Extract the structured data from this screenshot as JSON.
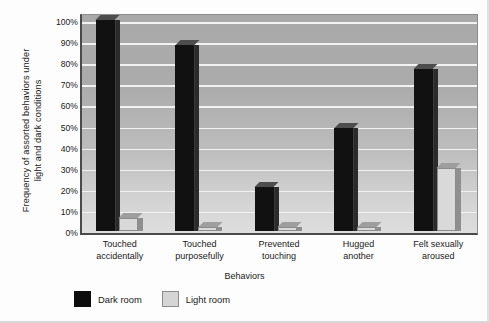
{
  "chart_data": {
    "type": "bar",
    "title": "",
    "xlabel": "Behaviors",
    "ylabel_line1": "Frequency of assorted behaviors under",
    "ylabel_line2": "light and dark conditions",
    "categories": [
      [
        "Touched",
        "accidentally"
      ],
      [
        "Touched",
        "purposefully"
      ],
      [
        "Prevented",
        "touching"
      ],
      [
        "Hugged",
        "another"
      ],
      [
        "Felt sexually",
        "aroused"
      ]
    ],
    "series": [
      {
        "name": "Dark room",
        "color": "#0d0d0d",
        "values": [
          100,
          88,
          21,
          49,
          77
        ]
      },
      {
        "name": "Light room",
        "color": "#d5d5d5",
        "values": [
          6,
          2,
          2,
          2,
          30
        ]
      }
    ],
    "ylim": [
      0,
      100
    ],
    "yticks": [
      0,
      10,
      20,
      30,
      40,
      50,
      60,
      70,
      80,
      90,
      100
    ],
    "ytick_labels": [
      "0%",
      "10%",
      "20%",
      "30%",
      "40%",
      "50%",
      "60%",
      "70%",
      "80%",
      "90%",
      "100%"
    ],
    "grid": true,
    "legend_position": "bottom-left",
    "plot_background": "#b4b4b4",
    "gridline_color": "#f2f2f2"
  }
}
